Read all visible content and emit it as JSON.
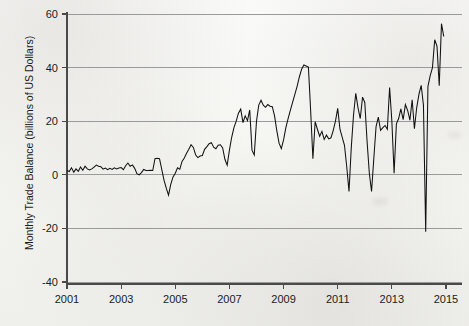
{
  "figure": {
    "kind": "scanned-line-chart",
    "background_color": "#f4f4f1",
    "line_color": "#111111",
    "grid_color": "#9a9a9a",
    "axis_color": "#4a4a4a"
  },
  "chart_data": {
    "type": "line",
    "title": "",
    "xlabel": "",
    "ylabel": "Monthly Trade Balance (billions of US Dollars)",
    "xlim": [
      2001.0,
      2015.0
    ],
    "ylim": [
      -40,
      60
    ],
    "grid": true,
    "legend": false,
    "y_ticks": [
      -40,
      -20,
      0,
      20,
      40,
      60
    ],
    "y_tick_labels": [
      "-40",
      "-20",
      "0",
      "20",
      "40",
      "60"
    ],
    "x_ticks": [
      2001,
      2003,
      2005,
      2007,
      2009,
      2011,
      2013,
      2015
    ],
    "x_tick_labels": [
      "2001",
      "2003",
      "2005",
      "2007",
      "2009",
      "2011",
      "2013",
      "2015"
    ],
    "series": [
      {
        "name": "Monthly Trade Balance",
        "x": [
          2001.0,
          2001.083,
          2001.167,
          2001.25,
          2001.333,
          2001.417,
          2001.5,
          2001.583,
          2001.667,
          2001.75,
          2001.833,
          2001.917,
          2002.0,
          2002.083,
          2002.167,
          2002.25,
          2002.333,
          2002.417,
          2002.5,
          2002.583,
          2002.667,
          2002.75,
          2002.833,
          2002.917,
          2003.0,
          2003.083,
          2003.167,
          2003.25,
          2003.333,
          2003.417,
          2003.5,
          2003.583,
          2003.667,
          2003.75,
          2003.833,
          2003.917,
          2004.0,
          2004.083,
          2004.167,
          2004.25,
          2004.333,
          2004.417,
          2004.5,
          2004.583,
          2004.667,
          2004.75,
          2004.833,
          2004.917,
          2005.0,
          2005.083,
          2005.167,
          2005.25,
          2005.333,
          2005.417,
          2005.5,
          2005.583,
          2005.667,
          2005.75,
          2005.833,
          2005.917,
          2006.0,
          2006.083,
          2006.167,
          2006.25,
          2006.333,
          2006.417,
          2006.5,
          2006.583,
          2006.667,
          2006.75,
          2006.833,
          2006.917,
          2007.0,
          2007.083,
          2007.167,
          2007.25,
          2007.333,
          2007.417,
          2007.5,
          2007.583,
          2007.667,
          2007.75,
          2007.833,
          2007.917,
          2008.0,
          2008.083,
          2008.167,
          2008.25,
          2008.333,
          2008.417,
          2008.5,
          2008.583,
          2008.667,
          2008.75,
          2008.833,
          2008.917,
          2009.0,
          2009.083,
          2009.167,
          2009.25,
          2009.333,
          2009.417,
          2009.5,
          2009.583,
          2009.667,
          2009.75,
          2009.833,
          2009.917,
          2010.0,
          2010.083,
          2010.167,
          2010.25,
          2010.333,
          2010.417,
          2010.5,
          2010.583,
          2010.667,
          2010.75,
          2010.833,
          2010.917,
          2011.0,
          2011.083,
          2011.167,
          2011.25,
          2011.333,
          2011.417,
          2011.5,
          2011.583,
          2011.667,
          2011.75,
          2011.833,
          2011.917,
          2012.0,
          2012.083,
          2012.167,
          2012.25,
          2012.333,
          2012.417,
          2012.5,
          2012.583,
          2012.667,
          2012.75,
          2012.833,
          2012.917,
          2013.0,
          2013.083,
          2013.167,
          2013.25,
          2013.333,
          2013.417,
          2013.5,
          2013.583,
          2013.667,
          2013.75,
          2013.833,
          2013.917,
          2014.0,
          2014.083,
          2014.167,
          2014.25,
          2014.333,
          2014.417,
          2014.5,
          2014.583,
          2014.667,
          2014.75,
          2014.833,
          2014.917
        ],
        "values": [
          1.6,
          1.2,
          2.6,
          1.0,
          2.2,
          1.3,
          2.9,
          1.7,
          3.2,
          2.2,
          1.8,
          2.2,
          2.9,
          3.6,
          3.2,
          3.0,
          2.1,
          2.5,
          1.9,
          2.4,
          2.0,
          2.6,
          2.2,
          2.5,
          2.7,
          1.9,
          3.4,
          4.4,
          3.2,
          3.7,
          2.4,
          0.4,
          0.0,
          0.8,
          2.0,
          1.6,
          1.6,
          1.7,
          1.6,
          6.0,
          6.2,
          6.0,
          2.0,
          -2.0,
          -5.0,
          -7.6,
          -3.6,
          -0.8,
          0.6,
          2.6,
          2.1,
          5.0,
          6.3,
          8.0,
          9.5,
          11.2,
          10.2,
          7.5,
          6.4,
          7.0,
          7.2,
          9.5,
          10.5,
          11.6,
          12.0,
          10.3,
          9.7,
          11.0,
          11.2,
          10.0,
          5.8,
          3.6,
          9.2,
          14.0,
          17.6,
          20.0,
          23.0,
          24.5,
          19.5,
          22.0,
          20.2,
          24.2,
          9.2,
          7.4,
          20.0,
          26.0,
          27.8,
          26.0,
          25.2,
          26.2,
          25.6,
          25.4,
          22.0,
          16.5,
          11.8,
          9.8,
          13.0,
          17.5,
          21.0,
          24.0,
          27.0,
          30.0,
          33.0,
          36.5,
          39.4,
          41.0,
          40.6,
          40.2,
          24.0,
          6.0,
          19.8,
          17.0,
          14.4,
          16.2,
          13.2,
          14.8,
          13.4,
          13.8,
          16.5,
          20.0,
          24.8,
          17.0,
          14.0,
          11.0,
          3.0,
          -6.2,
          10.0,
          22.2,
          30.4,
          25.0,
          21.0,
          29.0,
          27.0,
          12.8,
          0.6,
          -6.2,
          6.0,
          18.0,
          21.5,
          16.6,
          17.6,
          18.4,
          17.0,
          32.6,
          29.4,
          22.2,
          16.8,
          19.6,
          20.0,
          21.0,
          29.5,
          18.2,
          -30.2,
          20.0,
          19.6,
          20.2,
          20.0,
          28.2,
          31.0,
          32.6,
          31.6,
          29.2,
          21.0,
          28.2,
          33.4,
          32.2,
          30.6,
          20.6
        ]
      }
    ],
    "series_continuation": {
      "note": "tail segment 2013.9-2015 continues the same single series",
      "x": [
        2013.0,
        2013.083,
        2013.167,
        2013.25,
        2013.333,
        2013.417,
        2013.5,
        2013.583,
        2013.667,
        2013.75,
        2013.833,
        2013.917,
        2014.0,
        2014.083,
        2014.167,
        2014.25,
        2014.333,
        2014.417,
        2014.5,
        2014.583,
        2014.667,
        2014.75,
        2014.833,
        2014.917
      ],
      "values": [
        20.0,
        0.6,
        19.0,
        21.0,
        24.6,
        20.6,
        26.2,
        24.0,
        20.4,
        28.0,
        17.2,
        25.0,
        30.0,
        33.4,
        26.0,
        -21.2,
        33.0,
        37.0,
        40.0,
        50.4,
        48.0,
        33.2,
        56.4,
        51.6
      ]
    }
  },
  "axis": {
    "y_title": "Monthly Trade Balance (billions of US Dollars)",
    "y_labels": [
      "60",
      "40",
      "20",
      "0",
      "-20",
      "-40"
    ],
    "x_labels": [
      "2001",
      "2003",
      "2005",
      "2007",
      "2009",
      "2011",
      "2013",
      "2015"
    ]
  }
}
